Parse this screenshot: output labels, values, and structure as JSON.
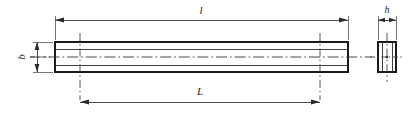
{
  "drawing": {
    "title": "Rectangular bar / key technical drawing",
    "background_color": "#ffffff",
    "line_color": "#1a1a1a",
    "views": {
      "front": {
        "name": "front-elevation",
        "shape": "rectangle",
        "x": 55,
        "y": 42,
        "width": 293,
        "height": 30
      },
      "side": {
        "name": "side-section",
        "shape": "rectangle",
        "x": 378,
        "y": 42,
        "width": 18,
        "height": 30
      }
    },
    "dimensions": [
      {
        "id": "length-overall",
        "label": "l",
        "orientation": "horizontal",
        "position": "top",
        "applies_to": "front-elevation",
        "line_y": 20,
        "x_start": 55,
        "x_end": 348,
        "label_x": 201,
        "label_y": 11
      },
      {
        "id": "width-b",
        "label": "b",
        "orientation": "vertical",
        "position": "left",
        "applies_to": "front-elevation",
        "line_x": 37,
        "y_start": 42,
        "y_end": 72,
        "label_x": 22,
        "label_y": 57
      },
      {
        "id": "length-L",
        "label": "L",
        "orientation": "horizontal",
        "position": "bottom",
        "applies_to": "front-elevation",
        "line_y": 102,
        "x_start": 80,
        "x_end": 320,
        "label_x": 200,
        "label_y": 92
      },
      {
        "id": "height-h",
        "label": "h",
        "orientation": "horizontal",
        "position": "top",
        "applies_to": "side-section",
        "line_y": 20,
        "x_start": 378,
        "x_end": 396,
        "label_x": 387,
        "label_y": 11
      }
    ],
    "center_lines": [
      {
        "id": "front-horizontal-axis",
        "orientation": "horizontal",
        "y": 57,
        "x_start": 30,
        "x_end": 372
      },
      {
        "id": "front-left-vertical-axis",
        "orientation": "vertical",
        "x": 80,
        "y_start": 33,
        "y_end": 100
      },
      {
        "id": "front-right-vertical-axis",
        "orientation": "vertical",
        "x": 320,
        "y_start": 33,
        "y_end": 100
      },
      {
        "id": "side-vertical-axis",
        "orientation": "vertical",
        "x": 387,
        "y_start": 33,
        "y_end": 82
      },
      {
        "id": "side-horizontal-axis",
        "orientation": "horizontal",
        "y": 57,
        "x_start": 370,
        "x_end": 404
      }
    ]
  }
}
